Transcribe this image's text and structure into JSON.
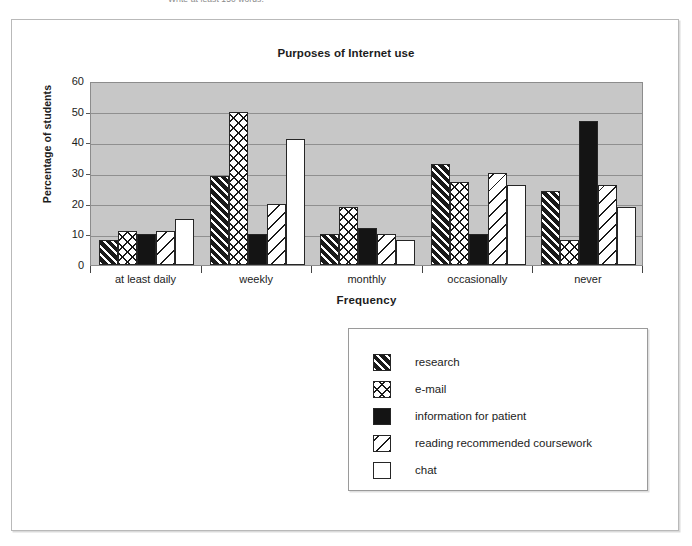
{
  "caption": {
    "text": "Write at least 150 words."
  },
  "chart_data": {
    "type": "bar",
    "title": "Purposes of Internet use",
    "xlabel": "Frequency",
    "ylabel": "Percentage of students",
    "categories": [
      "at least daily",
      "weekly",
      "monthly",
      "occasionally",
      "never"
    ],
    "ylim": [
      0,
      60
    ],
    "yticks": [
      0,
      10,
      20,
      30,
      40,
      50,
      60
    ],
    "grid": true,
    "legend_position": "below-right",
    "series": [
      {
        "name": "research",
        "pattern": "dark-diagonal-hatch",
        "values": [
          8,
          29,
          10,
          33,
          24
        ]
      },
      {
        "name": "e-mail",
        "pattern": "cross-hatch",
        "values": [
          11,
          50,
          19,
          27,
          8
        ]
      },
      {
        "name": "information for patient",
        "pattern": "solid-black",
        "values": [
          10,
          10,
          12,
          10,
          47
        ]
      },
      {
        "name": "reading recommended coursework",
        "pattern": "light-diagonal-hatch",
        "values": [
          11,
          20,
          10,
          30,
          26
        ]
      },
      {
        "name": "chat",
        "pattern": "white",
        "values": [
          15,
          41,
          8,
          26,
          19
        ]
      }
    ]
  },
  "colors": {
    "plot_background": "#c7c7c7",
    "gridline": "#8f8f8f",
    "bar_outline": "#262626",
    "text": "#1c1c1c"
  }
}
